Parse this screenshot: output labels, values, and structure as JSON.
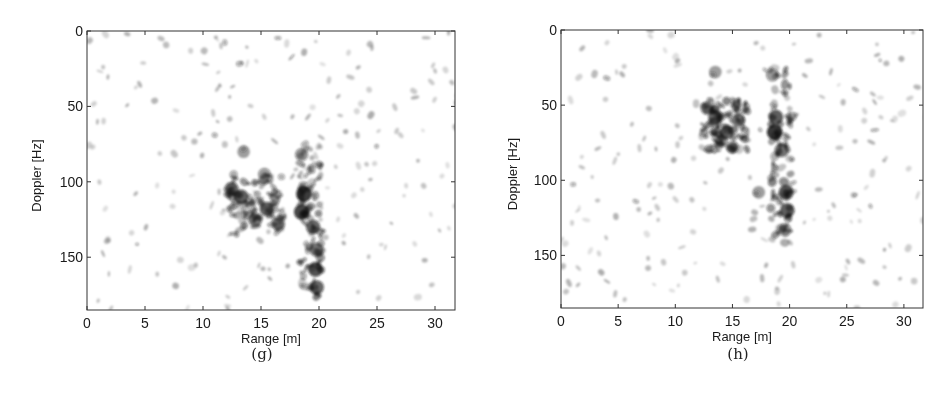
{
  "figure": {
    "panels": [
      {
        "id": "g",
        "caption": "(g)"
      },
      {
        "id": "h",
        "caption": "(h)"
      }
    ]
  },
  "chart_data": [
    {
      "type": "heatmap",
      "title": "",
      "caption": "(g)",
      "xlabel": "Range [m]",
      "ylabel": "Doppler [Hz]",
      "xlim": [
        0,
        32
      ],
      "ylim": [
        185,
        0
      ],
      "xticks": [
        0,
        5,
        10,
        15,
        20,
        25,
        30
      ],
      "yticks": [
        0,
        50,
        100,
        150
      ],
      "colormap": "gray_r (white = low, black = high)",
      "grid": false,
      "legend": null,
      "features": [
        {
          "name": "main-cluster",
          "range_m": [
            12,
            17
          ],
          "doppler_hz": [
            95,
            135
          ]
        },
        {
          "name": "vertical-streak",
          "range_m": [
            18.3,
            20.3
          ],
          "doppler_hz": [
            75,
            178
          ]
        }
      ],
      "strong_points": [
        {
          "range": 18.7,
          "doppler": 108,
          "intensity": 0.95
        },
        {
          "range": 18.5,
          "doppler": 120,
          "intensity": 0.9
        },
        {
          "range": 13.3,
          "doppler": 110,
          "intensity": 0.8
        },
        {
          "range": 15.5,
          "doppler": 118,
          "intensity": 0.75
        },
        {
          "range": 19.7,
          "doppler": 158,
          "intensity": 0.85
        },
        {
          "range": 19.8,
          "doppler": 170,
          "intensity": 0.75
        },
        {
          "range": 19.5,
          "doppler": 130,
          "intensity": 0.75
        },
        {
          "range": 19.8,
          "doppler": 145,
          "intensity": 0.7
        },
        {
          "range": 14.5,
          "doppler": 125,
          "intensity": 0.7
        },
        {
          "range": 12.5,
          "doppler": 105,
          "intensity": 0.65
        },
        {
          "range": 16.5,
          "doppler": 128,
          "intensity": 0.6
        },
        {
          "range": 18.5,
          "doppler": 82,
          "intensity": 0.55
        },
        {
          "range": 15.3,
          "doppler": 95,
          "intensity": 0.5
        },
        {
          "range": 13.5,
          "doppler": 80,
          "intensity": 0.45
        }
      ],
      "seed": 7
    },
    {
      "type": "heatmap",
      "title": "",
      "caption": "(h)",
      "xlabel": "Range [m]",
      "ylabel": "Doppler [Hz]",
      "xlim": [
        0,
        32
      ],
      "ylim": [
        185,
        0
      ],
      "xticks": [
        0,
        5,
        10,
        15,
        20,
        25,
        30
      ],
      "yticks": [
        0,
        50,
        100,
        150
      ],
      "colormap": "gray_r (white = low, black = high)",
      "grid": false,
      "legend": null,
      "features": [
        {
          "name": "main-cluster",
          "range_m": [
            12.3,
            16.5
          ],
          "doppler_hz": [
            45,
            82
          ]
        },
        {
          "name": "vertical-streak",
          "range_m": [
            18.3,
            20.3
          ],
          "doppler_hz": [
            25,
            145
          ]
        }
      ],
      "strong_points": [
        {
          "range": 18.7,
          "doppler": 68,
          "intensity": 0.98
        },
        {
          "range": 18.8,
          "doppler": 58,
          "intensity": 0.8
        },
        {
          "range": 19.7,
          "doppler": 108,
          "intensity": 0.85
        },
        {
          "range": 19.8,
          "doppler": 120,
          "intensity": 0.8
        },
        {
          "range": 19.3,
          "doppler": 80,
          "intensity": 0.7
        },
        {
          "range": 13.5,
          "doppler": 58,
          "intensity": 0.75
        },
        {
          "range": 14.5,
          "doppler": 68,
          "intensity": 0.7
        },
        {
          "range": 15.5,
          "doppler": 60,
          "intensity": 0.65
        },
        {
          "range": 12.8,
          "doppler": 52,
          "intensity": 0.6
        },
        {
          "range": 14.0,
          "doppler": 74,
          "intensity": 0.55
        },
        {
          "range": 15.0,
          "doppler": 78,
          "intensity": 0.5
        },
        {
          "range": 18.5,
          "doppler": 30,
          "intensity": 0.5
        },
        {
          "range": 13.5,
          "doppler": 28,
          "intensity": 0.45
        },
        {
          "range": 17.3,
          "doppler": 108,
          "intensity": 0.45
        },
        {
          "range": 19.6,
          "doppler": 133,
          "intensity": 0.5
        }
      ],
      "seed": 19
    }
  ]
}
